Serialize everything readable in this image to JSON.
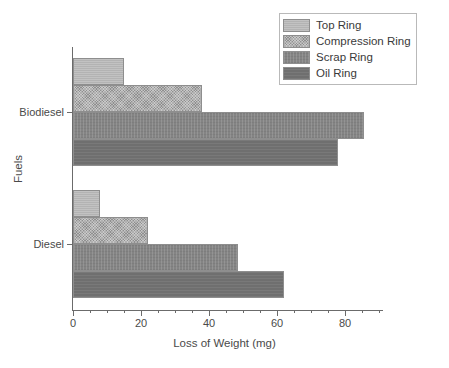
{
  "chart_data": {
    "type": "bar",
    "orientation": "horizontal",
    "title": "",
    "xlabel": "Loss of Weight (mg)",
    "ylabel": "Fuels",
    "categories": [
      "Biodiesel",
      "Diesel"
    ],
    "series": [
      {
        "name": "Top Ring",
        "values": [
          15,
          8
        ],
        "color": "#b3b3b3"
      },
      {
        "name": "Compression Ring",
        "values": [
          38,
          22
        ],
        "color": "#8f8f8f"
      },
      {
        "name": "Scrap Ring",
        "values": [
          85.5,
          48.5
        ],
        "color": "#848484"
      },
      {
        "name": "Oil Ring",
        "values": [
          78,
          62
        ],
        "color": "#6f6f6f"
      }
    ],
    "xlim": [
      0,
      91
    ],
    "xticks": [
      0,
      20,
      40,
      60,
      80
    ],
    "xtick_labels": [
      "0",
      "20",
      "40",
      "60",
      "80"
    ],
    "xminor_step": 5,
    "grid": false,
    "legend_position": "top-right"
  },
  "legend": {
    "entries": [
      {
        "label": "Top Ring"
      },
      {
        "label": "Compression Ring"
      },
      {
        "label": "Scrap Ring"
      },
      {
        "label": "Oil Ring"
      }
    ]
  },
  "axes": {
    "x_title": "Loss of Weight (mg)",
    "y_title": "Fuels",
    "y_labels": [
      "Biodiesel",
      "Diesel"
    ],
    "x_labels": [
      "0",
      "20",
      "40",
      "60",
      "80"
    ]
  }
}
